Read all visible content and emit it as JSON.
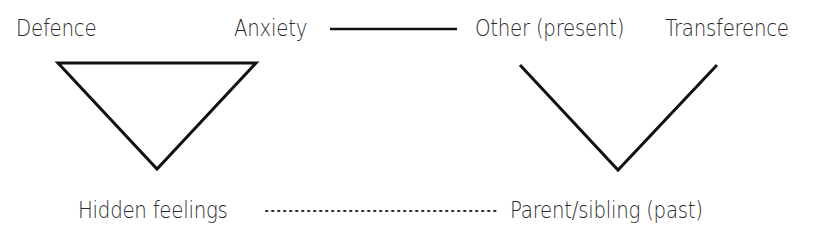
{
  "labels": {
    "defence": "Defence",
    "anxiety": "Anxiety",
    "hidden_feelings": "Hidden feelings",
    "other_present": "Other (present)",
    "transference": "Transference",
    "parent_sibling_past": "Parent/sibling (past)"
  },
  "diagram": {
    "left_figure": "triangle-of-conflict",
    "right_figure": "triangle-of-person-open",
    "connectors": [
      "solid-line Anxiety to Other (present)",
      "dotted-line Hidden feelings to Parent/sibling (past)"
    ],
    "stroke_color": "#111111"
  }
}
